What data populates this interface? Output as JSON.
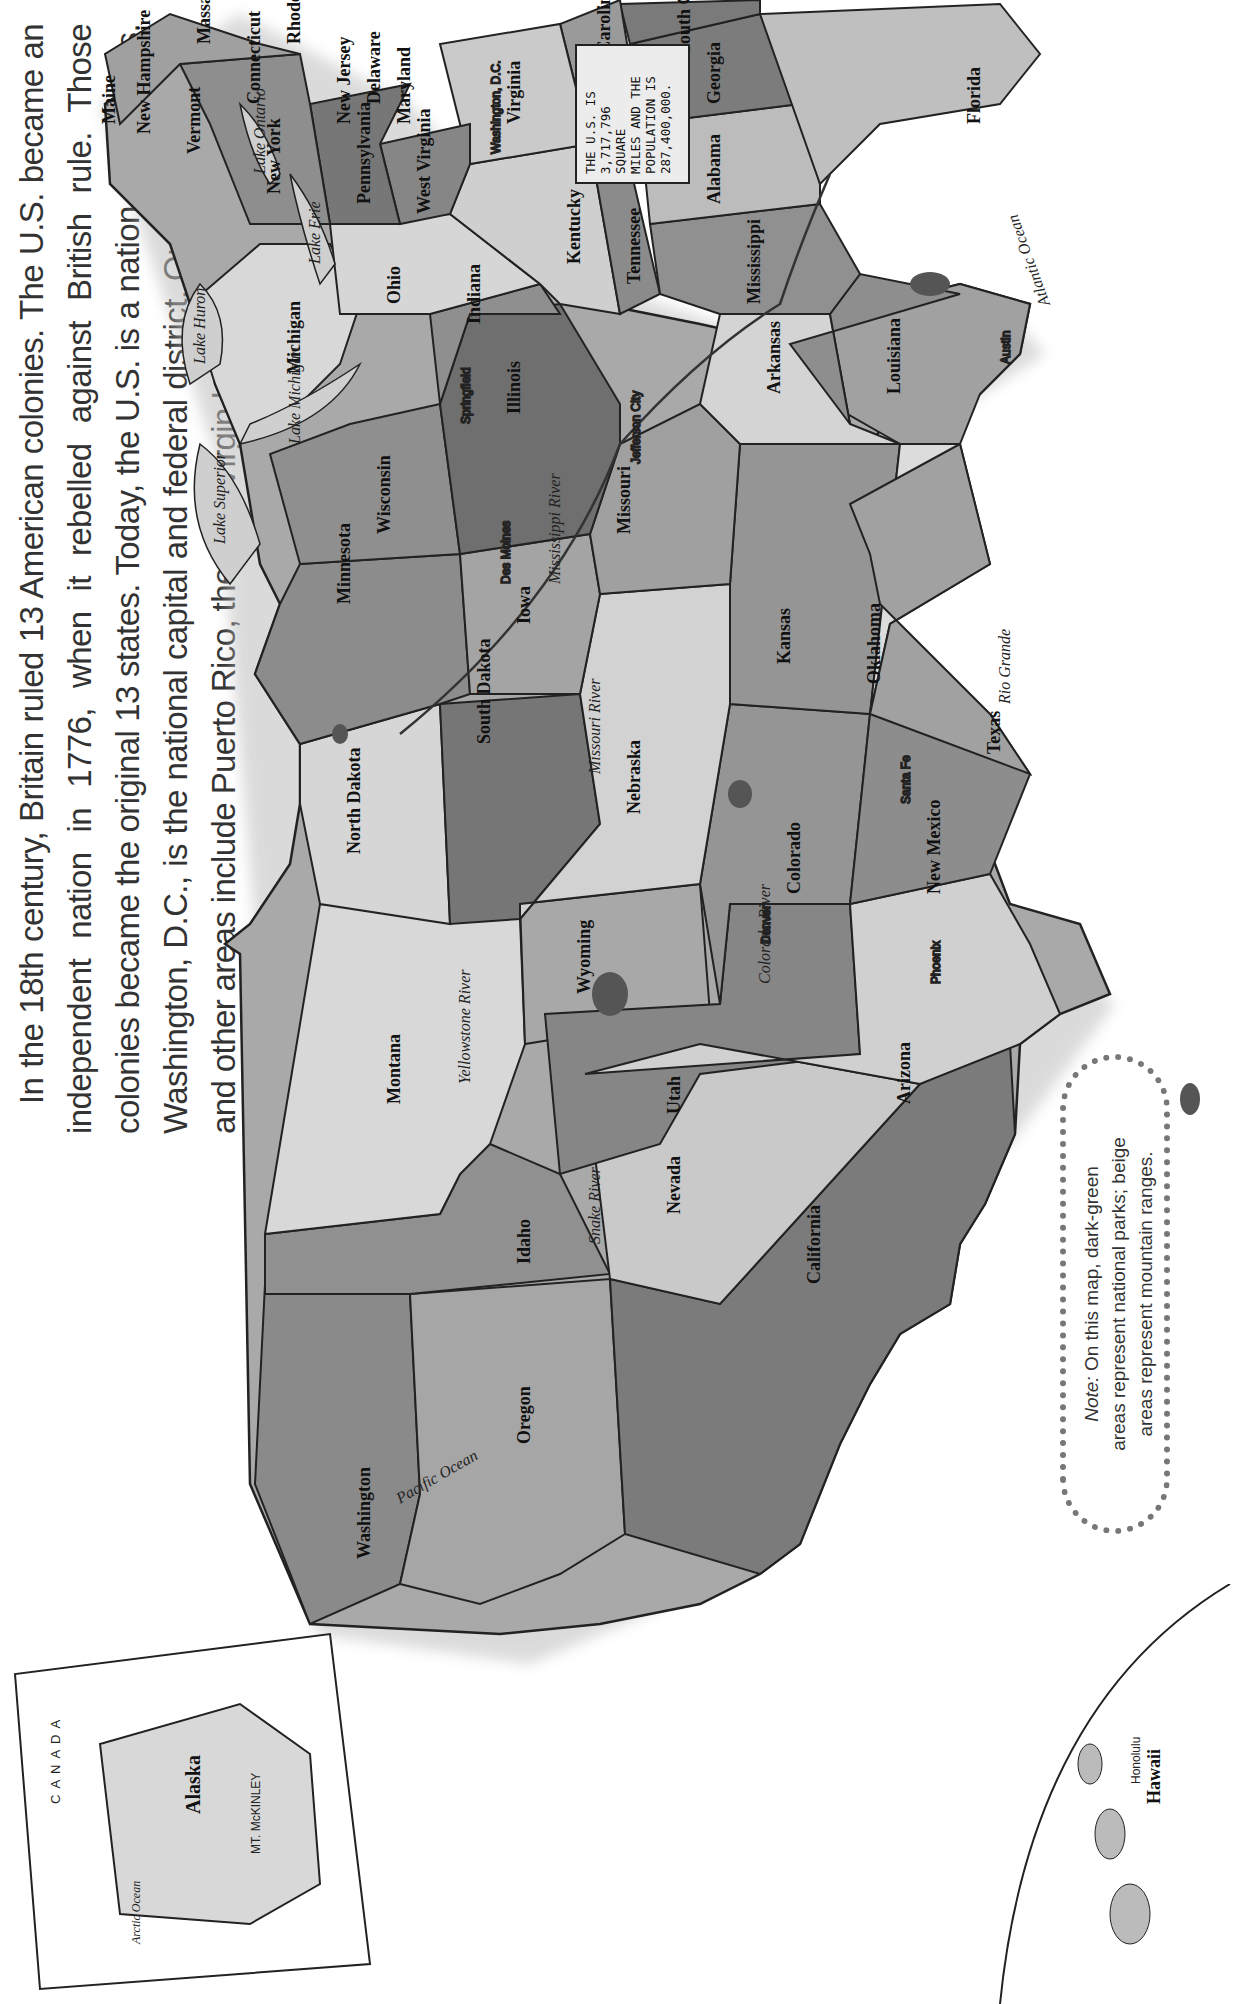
{
  "intro": {
    "paragraph": "In the 18th century, Britain ruled 13 American colonies. The U.S. became an independent nation in 1776, when it rebelled against British rule. Those colonies became the original 13 states. Today, the U.S. is a nation of 50 states. Washington, D.C., is the national capital and federal district. Outlying territories and other areas include Puerto Rico, the U.S. Virgin Islands, and Guam."
  },
  "fact_box": {
    "line1": "THE U.S. IS",
    "line2": "3,717,796 SQUARE",
    "line3": "MILES AND THE",
    "line4": "POPULATION IS",
    "line5": "287,400,000."
  },
  "note": {
    "prefix": "Note:",
    "line1": " On this map, dark-green",
    "line2": "areas represent national parks; beige",
    "line3": "areas represent mountain ranges."
  },
  "colors": {
    "light": "#d8d8d8",
    "medium": "#a9a9a9",
    "dark": "#7e7e7e",
    "darker": "#6e6e6e",
    "park": "#555555",
    "water": "#cfcfcf",
    "border": "#222222"
  },
  "states": [
    {
      "name": "Washington",
      "capital": "Olympia"
    },
    {
      "name": "Oregon",
      "capital": "Salem"
    },
    {
      "name": "California",
      "capital": "Sacramento"
    },
    {
      "name": "Idaho",
      "capital": "Boise"
    },
    {
      "name": "Nevada",
      "capital": "Carson City"
    },
    {
      "name": "Montana",
      "capital": "Helena"
    },
    {
      "name": "Wyoming",
      "capital": "Cheyenne"
    },
    {
      "name": "Utah",
      "capital": "Salt Lake City"
    },
    {
      "name": "Arizona",
      "capital": "Phoenix"
    },
    {
      "name": "Colorado",
      "capital": "Denver"
    },
    {
      "name": "New Mexico",
      "capital": "Santa Fe"
    },
    {
      "name": "North Dakota",
      "capital": "Bismarck"
    },
    {
      "name": "South Dakota",
      "capital": "Pierre"
    },
    {
      "name": "Nebraska",
      "capital": "Lincoln"
    },
    {
      "name": "Kansas",
      "capital": "Topeka"
    },
    {
      "name": "Oklahoma",
      "capital": "Oklahoma City"
    },
    {
      "name": "Texas",
      "capital": "Austin"
    },
    {
      "name": "Minnesota",
      "capital": "St. Paul"
    },
    {
      "name": "Iowa",
      "capital": "Des Moines"
    },
    {
      "name": "Missouri",
      "capital": "Jefferson City"
    },
    {
      "name": "Arkansas",
      "capital": "Little Rock"
    },
    {
      "name": "Louisiana",
      "capital": "Baton Rouge"
    },
    {
      "name": "Wisconsin",
      "capital": "Madison"
    },
    {
      "name": "Illinois",
      "capital": "Springfield"
    },
    {
      "name": "Michigan",
      "capital": "Lansing"
    },
    {
      "name": "Indiana",
      "capital": "Indianapolis"
    },
    {
      "name": "Ohio",
      "capital": "Columbus"
    },
    {
      "name": "Kentucky",
      "capital": "Frankfort"
    },
    {
      "name": "Tennessee",
      "capital": "Nashville"
    },
    {
      "name": "Mississippi",
      "capital": "Jackson"
    },
    {
      "name": "Alabama",
      "capital": "Montgomery"
    },
    {
      "name": "Georgia",
      "capital": "Atlanta"
    },
    {
      "name": "Florida",
      "capital": "Tallahassee"
    },
    {
      "name": "South Carolina",
      "capital": "Columbia"
    },
    {
      "name": "North Carolina",
      "capital": "Raleigh"
    },
    {
      "name": "Virginia",
      "capital": "Richmond"
    },
    {
      "name": "West Virginia",
      "capital": "Charleston"
    },
    {
      "name": "Pennsylvania",
      "capital": "Harrisburg"
    },
    {
      "name": "New York",
      "capital": "Albany"
    },
    {
      "name": "Maryland",
      "capital": "Annapolis"
    },
    {
      "name": "Delaware",
      "capital": "Dover"
    },
    {
      "name": "New Jersey",
      "capital": "Trenton"
    },
    {
      "name": "Connecticut",
      "capital": "Hartford"
    },
    {
      "name": "Rhode Island",
      "capital": "Providence"
    },
    {
      "name": "Massachusetts",
      "capital": "Boston"
    },
    {
      "name": "Vermont",
      "capital": "Montpelier"
    },
    {
      "name": "New Hampshire",
      "capital": "Concord"
    },
    {
      "name": "Maine",
      "capital": "Augusta"
    },
    {
      "name": "Alaska",
      "capital": "Juneau"
    },
    {
      "name": "Hawaii",
      "capital": "Honolulu"
    }
  ],
  "federal_district": "Washington, D.C.",
  "water_labels": {
    "pacific": "Pacific Ocean",
    "atlantic": "Atlantic Ocean",
    "arctic": "Arctic Ocean",
    "lake_superior": "Lake Superior",
    "lake_michigan": "Lake Michigan",
    "lake_huron": "Lake Huron",
    "lake_erie": "Lake Erie",
    "lake_ontario": "Lake Ontario",
    "mississippi": "Mississippi River",
    "missouri": "Missouri River",
    "yellowstone": "Yellowstone River",
    "snake": "Snake River",
    "colorado": "Colorado River",
    "rio_grande": "Rio Grande",
    "ohio": "Ohio River"
  },
  "alaska_inset": {
    "country": "CANADA",
    "peak": "MT. McKINLEY",
    "town": "Atka"
  }
}
